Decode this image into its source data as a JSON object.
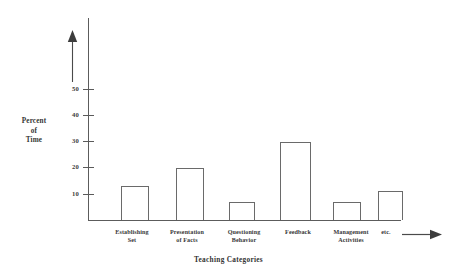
{
  "chart_data": {
    "type": "bar",
    "title": "",
    "subtitle": "",
    "xlabel": "Teaching Categories",
    "ylabel": "Percent of Time",
    "ylabel_lines": [
      "Percent",
      "of",
      "Time"
    ],
    "categories": [
      "Establishing Set",
      "Presentation of Facts",
      "Questioning Behavior",
      "Feedback",
      "Management Activities",
      "etc."
    ],
    "category_lines": [
      [
        "Establishing",
        "Set"
      ],
      [
        "Presentation",
        "of Facts"
      ],
      [
        "Questioning",
        "Behavior"
      ],
      [
        "Feedback"
      ],
      [
        "Management",
        "Activities"
      ],
      [
        "etc."
      ]
    ],
    "values": [
      13,
      20,
      7,
      30,
      7,
      11
    ],
    "ylim": [
      0,
      57
    ],
    "ytick_labels": [
      "10",
      "20",
      "30",
      "40",
      "50"
    ],
    "ytick_values": [
      10,
      20,
      30,
      40,
      50
    ],
    "grid": false,
    "legend": null,
    "bar_fill_color": "#ffffff",
    "bar_edge_color": "#6a6a6a",
    "axis_color": "#5c5c5c",
    "text_color": "#373737",
    "background_color": "#ffffff",
    "annotations": [
      {
        "name": "y-axis-direction-arrow",
        "direction": "up"
      },
      {
        "name": "x-axis-direction-arrow",
        "direction": "right"
      }
    ]
  },
  "axis": {
    "x_title": "Teaching Categories"
  }
}
